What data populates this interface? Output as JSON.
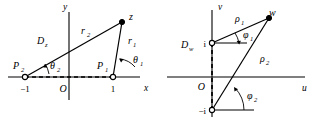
{
  "figure": {
    "name": "complex-plane-mapping-figure",
    "panels": [
      {
        "id": "z-plane",
        "region_label": "D",
        "region_label_sub": "z",
        "axis_horizontal": "x",
        "axis_vertical": "y",
        "origin_label": "O",
        "ticks": [
          {
            "label": "−1"
          },
          {
            "label": "1"
          }
        ],
        "points": [
          {
            "name": "P2",
            "label": "P",
            "sub": "2"
          },
          {
            "name": "P1",
            "label": "P",
            "sub": "1"
          },
          {
            "name": "z",
            "label": "z",
            "sub": ""
          }
        ],
        "rays": [
          {
            "label": "r",
            "sub": "2"
          },
          {
            "label": "r",
            "sub": "1"
          }
        ],
        "angles": [
          {
            "label": "θ",
            "sub": "2"
          },
          {
            "label": "θ",
            "sub": "1"
          }
        ]
      },
      {
        "id": "w-plane",
        "region_label": "D",
        "region_label_sub": "w",
        "axis_horizontal": "u",
        "axis_vertical": "v",
        "origin_label": "O",
        "ticks": [
          {
            "label": "i"
          },
          {
            "label": "−i"
          }
        ],
        "points": [
          {
            "name": "w",
            "label": "w",
            "sub": ""
          }
        ],
        "rays": [
          {
            "label": "ρ",
            "sub": "1"
          },
          {
            "label": "ρ",
            "sub": "2"
          }
        ],
        "angles": [
          {
            "label": "φ",
            "sub": "1"
          },
          {
            "label": "φ",
            "sub": "2"
          }
        ]
      }
    ],
    "colors": {
      "ink": "#000000",
      "background": "#ffffff"
    }
  }
}
